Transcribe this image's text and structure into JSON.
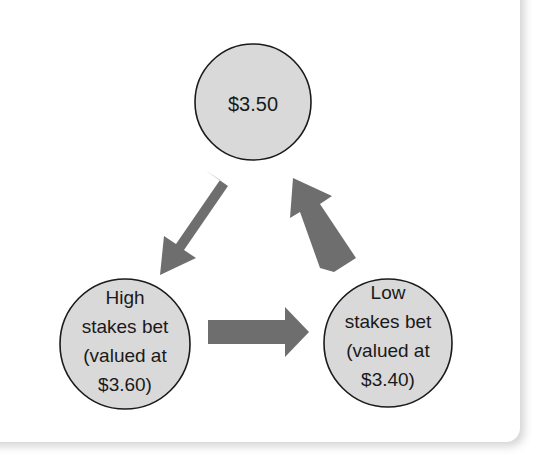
{
  "diagram": {
    "type": "cycle",
    "colors": {
      "node_fill": "#d9d9d9",
      "node_stroke": "#1a1a1a",
      "arrow_fill": "#6e6e6e",
      "background": "#ffffff"
    },
    "nodes": [
      {
        "id": "top",
        "lines": [
          "$3.50"
        ]
      },
      {
        "id": "high",
        "lines": [
          "High",
          "stakes bet",
          "(valued at",
          "$3.60)"
        ]
      },
      {
        "id": "low",
        "lines": [
          "Low",
          "stakes bet",
          "(valued at",
          "$3.40)"
        ]
      }
    ],
    "edges": [
      {
        "from": "top",
        "to": "high"
      },
      {
        "from": "high",
        "to": "low"
      },
      {
        "from": "low",
        "to": "top"
      }
    ]
  }
}
